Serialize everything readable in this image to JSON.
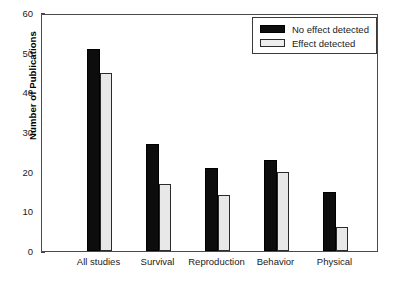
{
  "chart_data": {
    "type": "bar",
    "title": "",
    "subtitle": "",
    "xlabel": "",
    "ylabel": "Number of Publications",
    "categories": [
      "All studies",
      "Survival",
      "Reproduction",
      "Behavior",
      "Physical"
    ],
    "series": [
      {
        "name": "No effect detected",
        "color": "#0d0d0d",
        "values": [
          51,
          27,
          21,
          23,
          15
        ]
      },
      {
        "name": "Effect detected",
        "color": "#e8e8e8",
        "values": [
          45,
          17,
          14,
          20,
          6
        ]
      }
    ],
    "ylim": [
      0,
      60
    ],
    "yticks": [
      0,
      10,
      20,
      30,
      40,
      50,
      60
    ],
    "ytick_labels": [
      "0",
      "10",
      "20",
      "30",
      "40",
      "50",
      "60"
    ],
    "grid": false,
    "legend_position": "top-right",
    "legend_entries": [
      "No effect detected",
      "Effect detected"
    ],
    "annotations": []
  }
}
